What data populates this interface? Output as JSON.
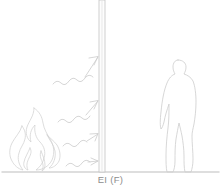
{
  "diagram": {
    "label": "EI (F)",
    "background_color": "#ffffff",
    "line_color": "#cfcfcf",
    "ground_color": "#b5b5b5",
    "label_color": "#8d8d8d",
    "wall": {
      "name": "fire wall",
      "classification": "EI (F)",
      "fill_color": "#fdfdfd",
      "edge_color": "#c4c4c4",
      "x": 99,
      "width": 6,
      "top": 0,
      "bottom": 172
    },
    "flame": {
      "name": "fire source",
      "side": "left",
      "color": "#d2d2d2",
      "bounds": {
        "x": 5,
        "y": 107,
        "width": 52,
        "height": 65
      }
    },
    "person": {
      "name": "occupant silhouette",
      "side": "right",
      "color": "#d0d0d0",
      "bounds": {
        "x": 160,
        "y": 60,
        "width": 38,
        "height": 112
      }
    },
    "heat_arrows": {
      "name": "radiated heat arrows",
      "count": 4,
      "direction": "left-to-right toward wall",
      "color": "#cbcbcb",
      "tip_y_values": [
        56,
        100,
        133,
        161
      ]
    },
    "ground": {
      "name": "ground line",
      "y": 172,
      "x_start": 2,
      "x_end": 219
    }
  }
}
